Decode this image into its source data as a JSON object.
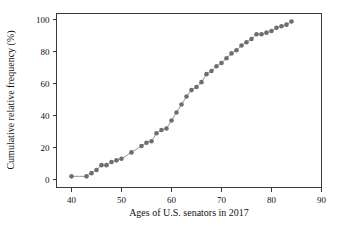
{
  "chart_data": {
    "type": "line",
    "title": "",
    "xlabel": "Ages of U.S. senators in 2017",
    "ylabel": "Cumulative relative frequency (%)",
    "xlim": [
      37,
      90
    ],
    "ylim": [
      -5,
      104
    ],
    "xticks": [
      40,
      50,
      60,
      70,
      80,
      90
    ],
    "xtick_labels": [
      "40",
      "50",
      "60",
      "70",
      "80",
      "90"
    ],
    "yticks": [
      0,
      20,
      40,
      60,
      80,
      100
    ],
    "ytick_labels": [
      "0",
      "20",
      "40",
      "60",
      "80",
      "100"
    ],
    "grid": false,
    "legend": "none",
    "marker": "filled-circle",
    "marker_color": "#6e6e6e",
    "line_color": "#8a8a8a",
    "frame_color": "#3a3a3a",
    "x": [
      40,
      43,
      44,
      45,
      46,
      47,
      48,
      49,
      50,
      52,
      54,
      55,
      56,
      57,
      58,
      59,
      60,
      61,
      62,
      63,
      64,
      65,
      66,
      67,
      68,
      69,
      70,
      71,
      72,
      73,
      74,
      75,
      76,
      77,
      78,
      79,
      80,
      81,
      82,
      83,
      84
    ],
    "y": [
      2,
      2,
      4,
      6,
      9,
      9,
      11,
      12,
      13,
      17,
      21,
      23,
      24,
      29,
      31,
      32,
      37,
      42,
      47,
      52,
      56,
      58,
      61,
      66,
      68,
      71,
      73,
      76,
      79,
      81,
      84,
      86,
      88,
      91,
      91,
      92,
      93,
      95,
      96,
      97,
      99
    ],
    "points": [
      {
        "age": 40,
        "cum_pct": 2
      },
      {
        "age": 43,
        "cum_pct": 2
      },
      {
        "age": 44,
        "cum_pct": 4
      },
      {
        "age": 45,
        "cum_pct": 6
      },
      {
        "age": 46,
        "cum_pct": 9
      },
      {
        "age": 47,
        "cum_pct": 9
      },
      {
        "age": 48,
        "cum_pct": 11
      },
      {
        "age": 49,
        "cum_pct": 12
      },
      {
        "age": 50,
        "cum_pct": 13
      },
      {
        "age": 52,
        "cum_pct": 17
      },
      {
        "age": 54,
        "cum_pct": 21
      },
      {
        "age": 55,
        "cum_pct": 23
      },
      {
        "age": 56,
        "cum_pct": 24
      },
      {
        "age": 57,
        "cum_pct": 29
      },
      {
        "age": 58,
        "cum_pct": 31
      },
      {
        "age": 59,
        "cum_pct": 32
      },
      {
        "age": 60,
        "cum_pct": 37
      },
      {
        "age": 61,
        "cum_pct": 42
      },
      {
        "age": 62,
        "cum_pct": 47
      },
      {
        "age": 63,
        "cum_pct": 52
      },
      {
        "age": 64,
        "cum_pct": 56
      },
      {
        "age": 65,
        "cum_pct": 58
      },
      {
        "age": 66,
        "cum_pct": 61
      },
      {
        "age": 67,
        "cum_pct": 66
      },
      {
        "age": 68,
        "cum_pct": 68
      },
      {
        "age": 69,
        "cum_pct": 71
      },
      {
        "age": 70,
        "cum_pct": 73
      },
      {
        "age": 71,
        "cum_pct": 76
      },
      {
        "age": 72,
        "cum_pct": 79
      },
      {
        "age": 73,
        "cum_pct": 81
      },
      {
        "age": 74,
        "cum_pct": 84
      },
      {
        "age": 75,
        "cum_pct": 86
      },
      {
        "age": 76,
        "cum_pct": 88
      },
      {
        "age": 77,
        "cum_pct": 91
      },
      {
        "age": 78,
        "cum_pct": 91
      },
      {
        "age": 79,
        "cum_pct": 92
      },
      {
        "age": 80,
        "cum_pct": 93
      },
      {
        "age": 81,
        "cum_pct": 95
      },
      {
        "age": 82,
        "cum_pct": 96
      },
      {
        "age": 83,
        "cum_pct": 97
      },
      {
        "age": 84,
        "cum_pct": 99
      }
    ]
  }
}
